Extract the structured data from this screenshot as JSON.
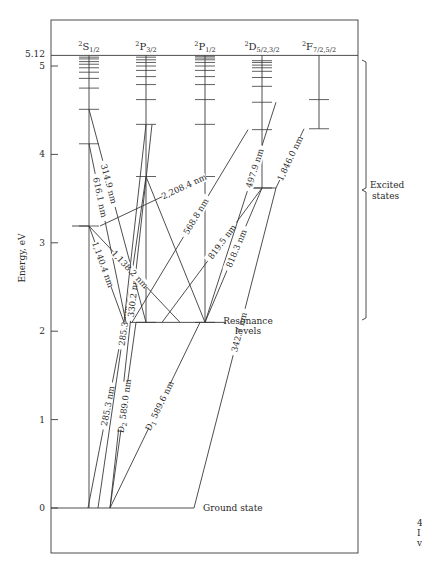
{
  "diagram": {
    "type": "energy-level-diagram",
    "y_axis": {
      "label": "Energy, eV",
      "ticks": [
        "0",
        "1",
        "2",
        "3",
        "4",
        "5"
      ],
      "tick_values": [
        0,
        1,
        2,
        3,
        4,
        5
      ],
      "top_value_label": "5.12",
      "top_value": 5.12
    },
    "columns": [
      {
        "id": "S",
        "sup": "2",
        "letter": "S",
        "sub": "1/2",
        "levels_eV": [
          0,
          3.19,
          4.12,
          4.51,
          4.75,
          4.86,
          4.93,
          4.98,
          5.02,
          5.05,
          5.08,
          5.1
        ]
      },
      {
        "id": "P32",
        "sup": "2",
        "letter": "P",
        "sub": "3/2",
        "levels_eV": [
          2.1,
          3.75,
          4.34,
          4.62,
          4.79,
          4.88,
          4.95,
          5.0,
          5.04,
          5.07,
          5.1
        ]
      },
      {
        "id": "P12",
        "sup": "2",
        "letter": "P",
        "sub": "1/2",
        "levels_eV": [
          2.1,
          3.75,
          4.34,
          4.62,
          4.79,
          4.88,
          4.95,
          5.0,
          5.04,
          5.07,
          5.09,
          5.11
        ]
      },
      {
        "id": "D",
        "sup": "2",
        "letter": "D",
        "sub": "5/2,3/2",
        "levels_eV": [
          3.62,
          4.28,
          4.59,
          4.77,
          4.87,
          4.94,
          4.98,
          5.01,
          5.04,
          5.06
        ]
      },
      {
        "id": "F",
        "sup": "2",
        "letter": "F",
        "sub": "7/2,5/2",
        "levels_eV": [
          4.29,
          4.62
        ]
      }
    ],
    "transitions": [
      {
        "label": "314.9 nm"
      },
      {
        "label": "616.1 nm"
      },
      {
        "label": "2,208.4 nm"
      },
      {
        "label": "1,138.2 nm"
      },
      {
        "label": "1,140.4 nm"
      },
      {
        "label": "568.8 nm"
      },
      {
        "label": "497.9 nm"
      },
      {
        "label": "819.5 nm"
      },
      {
        "label": "818.3 nm"
      },
      {
        "label": "1,846.0 nm"
      },
      {
        "label": "285.3 nm"
      },
      {
        "label": "330.2 nm"
      },
      {
        "label": "D",
        "sub": "2",
        "rest": " 589.0 nm"
      },
      {
        "label": "D",
        "sub": "1",
        "rest": " 589.6 nm"
      },
      {
        "label": "342.7 nm"
      }
    ],
    "annotations": {
      "excited_line1": "Excited",
      "excited_line2": "states",
      "resonance_line1": "Resonance",
      "resonance_line2": "levels",
      "ground": "Ground state"
    },
    "margin_fragment": [
      "4",
      "I",
      "v"
    ]
  }
}
